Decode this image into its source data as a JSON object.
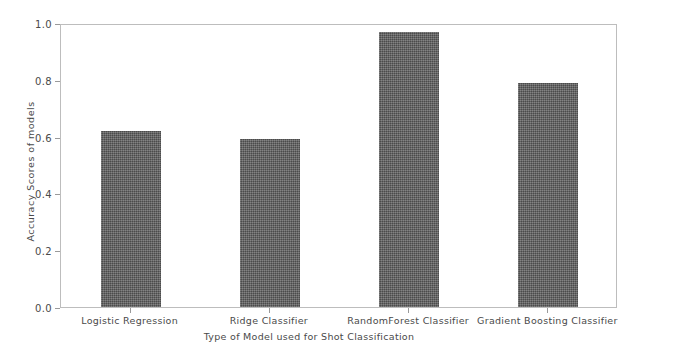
{
  "chart_data": {
    "type": "bar",
    "title": "",
    "xlabel": "Type of Model used for Shot Classification",
    "ylabel": "Accuracy Scores of models",
    "categories": [
      "Logistic Regression",
      "Ridge Classifier",
      "RandomForest Classifier",
      "Gradient Boosting Classifier"
    ],
    "values": [
      0.62,
      0.59,
      0.97,
      0.79
    ],
    "ylim": [
      0.0,
      1.0
    ],
    "ytick_labels": [
      "0.0",
      "0.2",
      "0.4",
      "0.6",
      "0.8",
      "1.0"
    ],
    "ytick_values": [
      0.0,
      0.2,
      0.4,
      0.6,
      0.8,
      1.0
    ],
    "grid": false,
    "legend": false,
    "bar_color": "#5c5c5c",
    "axes_color": "#bdbdbd",
    "text_color": "#4a4a4a",
    "background": "#ffffff"
  }
}
